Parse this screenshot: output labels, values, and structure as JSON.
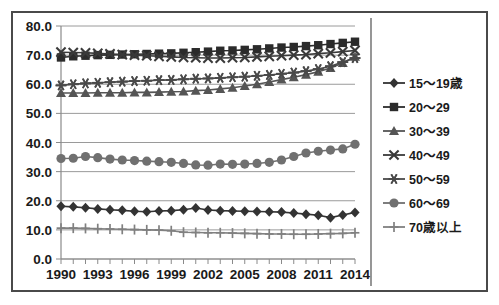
{
  "chart_data": {
    "type": "line",
    "title": "",
    "subtitle": "",
    "xlabel": "",
    "ylabel": "",
    "xlim": [
      1990,
      2014
    ],
    "ylim": [
      0.0,
      80.0
    ],
    "ytick_step": 10.0,
    "grid": true,
    "legend_position": "right",
    "x": [
      1990,
      1991,
      1992,
      1993,
      1994,
      1995,
      1996,
      1997,
      1998,
      1999,
      2000,
      2001,
      2002,
      2003,
      2004,
      2005,
      2006,
      2007,
      2008,
      2009,
      2010,
      2011,
      2012,
      2013,
      2014
    ],
    "xtick_labels": [
      "1990",
      "1993",
      "1996",
      "1999",
      "2002",
      "2005",
      "2008",
      "2011",
      "2014"
    ],
    "xtick_values": [
      1990,
      1993,
      1996,
      1999,
      2002,
      2005,
      2008,
      2011,
      2014
    ],
    "ytick_labels": [
      "0.0",
      "10.0",
      "20.0",
      "30.0",
      "40.0",
      "50.0",
      "60.0",
      "70.0",
      "80.0"
    ],
    "ytick_values": [
      0.0,
      10.0,
      20.0,
      30.0,
      40.0,
      50.0,
      60.0,
      70.0,
      80.0
    ],
    "series": [
      {
        "name": "15～19歳",
        "marker": "diamond",
        "color": "#333333",
        "values": [
          18.1,
          17.9,
          17.6,
          17.2,
          16.9,
          16.7,
          16.4,
          16.2,
          16.5,
          16.6,
          16.9,
          17.5,
          16.8,
          16.6,
          16.5,
          16.4,
          16.3,
          16.2,
          16.1,
          15.8,
          15.4,
          15.0,
          14.2,
          15.1,
          16.0
        ]
      },
      {
        "name": "20～29",
        "marker": "square",
        "color": "#2b2b2b",
        "values": [
          69.2,
          69.6,
          69.8,
          70.0,
          70.1,
          70.2,
          70.3,
          70.4,
          70.5,
          70.6,
          70.8,
          71.0,
          71.2,
          71.5,
          71.6,
          71.8,
          72.0,
          72.3,
          72.6,
          72.8,
          73.1,
          73.4,
          73.8,
          74.2,
          74.6
        ]
      },
      {
        "name": "30～39",
        "marker": "triangle",
        "color": "#555555",
        "values": [
          57.0,
          57.0,
          57.0,
          57.1,
          57.1,
          57.1,
          57.2,
          57.2,
          57.3,
          57.4,
          57.5,
          57.8,
          58.0,
          58.4,
          58.8,
          59.4,
          60.0,
          60.8,
          61.6,
          62.4,
          63.3,
          64.3,
          65.6,
          67.3,
          69.4
        ]
      },
      {
        "name": "40～49",
        "marker": "x",
        "color": "#3a3a3a",
        "values": [
          71.0,
          70.9,
          70.8,
          70.6,
          70.4,
          70.2,
          70.0,
          69.8,
          69.6,
          69.4,
          69.2,
          69.1,
          69.0,
          69.0,
          69.1,
          69.2,
          69.4,
          69.6,
          69.8,
          70.0,
          70.2,
          70.5,
          70.8,
          71.2,
          71.6
        ]
      },
      {
        "name": "50～59",
        "marker": "asterisk",
        "color": "#4a4a4a",
        "values": [
          59.6,
          60.0,
          60.3,
          60.5,
          60.7,
          60.9,
          61.1,
          61.2,
          61.4,
          61.5,
          61.7,
          61.9,
          62.0,
          62.2,
          62.4,
          62.6,
          62.9,
          63.2,
          63.6,
          64.0,
          64.5,
          65.2,
          66.2,
          67.6,
          69.0
        ]
      },
      {
        "name": "60～69",
        "marker": "circle",
        "color": "#707070",
        "values": [
          34.5,
          34.6,
          35.2,
          34.8,
          34.3,
          34.0,
          33.8,
          33.6,
          33.4,
          33.2,
          32.8,
          32.3,
          32.2,
          32.6,
          32.5,
          32.6,
          32.8,
          33.2,
          34.0,
          35.2,
          36.4,
          37.0,
          37.4,
          37.8,
          39.4
        ]
      },
      {
        "name": "70歳以上",
        "marker": "plus",
        "color": "#808080",
        "values": [
          10.6,
          10.6,
          10.5,
          10.4,
          10.3,
          10.2,
          10.1,
          10.0,
          9.9,
          9.7,
          9.2,
          9.1,
          9.0,
          9.0,
          8.9,
          8.8,
          8.7,
          8.6,
          8.6,
          8.5,
          8.5,
          8.6,
          8.7,
          8.8,
          9.0
        ]
      }
    ]
  },
  "axis": {
    "y_labels": [
      "80.0",
      "70.0",
      "60.0",
      "50.0",
      "40.0",
      "30.0",
      "20.0",
      "10.0",
      "0.0"
    ],
    "x_labels": [
      "1990",
      "1993",
      "1996",
      "1999",
      "2002",
      "2005",
      "2008",
      "2011",
      "2014"
    ]
  },
  "legend": {
    "items": [
      {
        "label": "15～19歳",
        "marker": "diamond-marker"
      },
      {
        "label": "20～29",
        "marker": "square-marker"
      },
      {
        "label": "30～39",
        "marker": "triangle-marker"
      },
      {
        "label": "40～49",
        "marker": "x-marker"
      },
      {
        "label": "50～59",
        "marker": "asterisk-marker"
      },
      {
        "label": "60～69",
        "marker": "circle-marker"
      },
      {
        "label": "70歳以上",
        "marker": "plus-marker"
      }
    ]
  },
  "colors": {
    "frame": "#4a4a4a",
    "grid": "#9a9a9a",
    "background": "#ffffff",
    "text": "#1a1a1a"
  }
}
